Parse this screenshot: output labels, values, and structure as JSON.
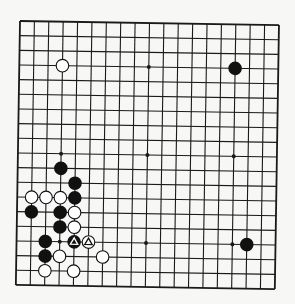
{
  "board": {
    "size": 19,
    "background": "#f7f7f5",
    "line_color": "#1a1a1a",
    "star_points": [
      [
        3,
        3
      ],
      [
        9,
        3
      ],
      [
        15,
        3
      ],
      [
        3,
        9
      ],
      [
        9,
        9
      ],
      [
        15,
        9
      ],
      [
        3,
        15
      ],
      [
        9,
        15
      ],
      [
        15,
        15
      ]
    ],
    "stones": [
      {
        "color": "white",
        "col": 3,
        "row": 3
      },
      {
        "color": "black",
        "col": 15,
        "row": 3
      },
      {
        "color": "black",
        "col": 3,
        "row": 10
      },
      {
        "color": "black",
        "col": 4,
        "row": 11
      },
      {
        "color": "white",
        "col": 1,
        "row": 12
      },
      {
        "color": "white",
        "col": 2,
        "row": 12
      },
      {
        "color": "white",
        "col": 3,
        "row": 12
      },
      {
        "color": "black",
        "col": 4,
        "row": 12
      },
      {
        "color": "black",
        "col": 1,
        "row": 13
      },
      {
        "color": "black",
        "col": 3,
        "row": 13
      },
      {
        "color": "white",
        "col": 4,
        "row": 13
      },
      {
        "color": "black",
        "col": 3,
        "row": 14
      },
      {
        "color": "white",
        "col": 4,
        "row": 14
      },
      {
        "color": "black",
        "col": 2,
        "row": 15
      },
      {
        "color": "black",
        "col": 4,
        "row": 15,
        "mark": "triangle"
      },
      {
        "color": "white",
        "col": 5,
        "row": 15,
        "mark": "triangle"
      },
      {
        "color": "black",
        "col": 16,
        "row": 15
      },
      {
        "color": "black",
        "col": 2,
        "row": 16
      },
      {
        "color": "white",
        "col": 3,
        "row": 16
      },
      {
        "color": "white",
        "col": 6,
        "row": 16
      },
      {
        "color": "white",
        "col": 2,
        "row": 17
      },
      {
        "color": "white",
        "col": 4,
        "row": 17
      }
    ]
  }
}
